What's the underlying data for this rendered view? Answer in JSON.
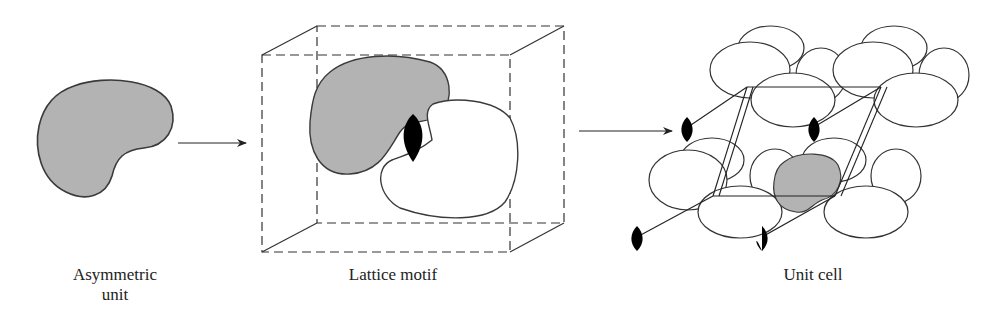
{
  "figure": {
    "panels": [
      {
        "id": "asymmetric-unit",
        "label_line1": "Asymmetric",
        "label_line2": "unit"
      },
      {
        "id": "lattice-motif",
        "label": "Lattice motif"
      },
      {
        "id": "unit-cell",
        "label": "Unit cell"
      }
    ],
    "arrows": [
      {
        "from": "asymmetric-unit",
        "to": "lattice-motif"
      },
      {
        "from": "lattice-motif",
        "to": "unit-cell"
      }
    ],
    "colors": {
      "shaded_fill": "#b3b3b3",
      "outline": "#333333",
      "symmetry_element": "#000000",
      "background": "#ffffff"
    }
  }
}
